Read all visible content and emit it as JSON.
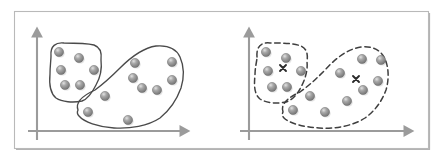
{
  "figure": {
    "width": 443,
    "height": 160,
    "background_color": "#ffffff",
    "frame": {
      "x": 14,
      "y": 11,
      "width": 414,
      "height": 137,
      "border_color": "#b9b9b9",
      "shadow_color": "#9a9a9a"
    },
    "colors": {
      "axis": "#9b9b9b",
      "point_fill": "#8f8f8f",
      "point_edge": "#6e6e6e",
      "point_highlight": "#dcdcdc",
      "hull_solid": "#4a4a4a",
      "hull_dashed": "#3f3f3f",
      "centroid": "#2b2b2b"
    }
  },
  "panels": [
    {
      "id": "left-panel",
      "name": "true-clusters-panel",
      "boundary_style": "solid",
      "shows_centroids": false,
      "origin": {
        "x": 37,
        "y": 131
      },
      "axes": {
        "x_axis": {
          "x1": 28,
          "y1": 131,
          "x2": 188,
          "y2": 131,
          "arrow": "right"
        },
        "y_axis": {
          "x1": 37,
          "y1": 140,
          "x2": 37,
          "y2": 29,
          "arrow": "up"
        }
      },
      "clusters": [
        {
          "id": "left-cluster-a",
          "label": "cluster-upper-left",
          "point_count": 6,
          "points": [
            {
              "x": 59,
              "y": 52
            },
            {
              "x": 79,
              "y": 58
            },
            {
              "x": 61,
              "y": 70
            },
            {
              "x": 94,
              "y": 70
            },
            {
              "x": 65,
              "y": 85
            },
            {
              "x": 80,
              "y": 85
            }
          ],
          "hull": "M 51 56 C 50 46 56 42 64 43 C 74 43 86 43 94 45 C 100 47 102 52 101 60 C 102 68 100 78 96 85 C 92 93 88 99 82 101 C 73 103 62 102 56 98 C 50 93 49 84 50 74 C 50 66 51 60 51 56 Z"
        },
        {
          "id": "left-cluster-b",
          "label": "cluster-lower-right",
          "point_count": 9,
          "points": [
            {
              "x": 135,
              "y": 63
            },
            {
              "x": 172,
              "y": 62
            },
            {
              "x": 133,
              "y": 78
            },
            {
              "x": 172,
              "y": 80
            },
            {
              "x": 105,
              "y": 96
            },
            {
              "x": 142,
              "y": 88
            },
            {
              "x": 157,
              "y": 90
            },
            {
              "x": 88,
              "y": 112
            },
            {
              "x": 128,
              "y": 120
            }
          ],
          "hull": "M 78 110 C 75 102 84 95 95 90 C 106 82 112 76 120 68 C 130 58 142 48 156 46 C 168 45 176 48 180 57 C 184 66 184 78 181 88 C 177 99 170 110 160 118 C 148 126 130 129 114 128 C 98 127 84 122 79 116 C 77 114 77 112 78 110 Z"
        }
      ]
    },
    {
      "id": "right-panel",
      "name": "kmeans-clusters-panel",
      "boundary_style": "dashed",
      "shows_centroids": true,
      "origin": {
        "x": 249,
        "y": 131
      },
      "axes": {
        "x_axis": {
          "x1": 240,
          "y1": 131,
          "x2": 412,
          "y2": 131,
          "arrow": "right"
        },
        "y_axis": {
          "x1": 249,
          "y1": 140,
          "x2": 249,
          "y2": 29,
          "arrow": "up"
        }
      },
      "clusters": [
        {
          "id": "right-cluster-a",
          "label": "kmeans-cluster-1",
          "point_count": 7,
          "centroid": {
            "x": 283,
            "y": 68,
            "marker": "x"
          },
          "points": [
            {
              "x": 266,
              "y": 52
            },
            {
              "x": 286,
              "y": 58
            },
            {
              "x": 268,
              "y": 71
            },
            {
              "x": 301,
              "y": 71
            },
            {
              "x": 272,
              "y": 87
            },
            {
              "x": 287,
              "y": 87
            },
            {
              "x": 310,
              "y": 96
            }
          ],
          "hull": "M 257 57 C 256 46 262 42 270 43 C 281 43 293 43 301 46 C 307 49 308 54 307 62 C 308 70 305 80 301 87 C 297 95 292 100 286 102 C 277 104 266 103 260 99 C 254 94 254 85 255 75 C 255 67 257 61 257 57 Z"
        },
        {
          "id": "right-cluster-b",
          "label": "kmeans-cluster-2",
          "point_count": 8,
          "centroid": {
            "x": 356,
            "y": 79,
            "marker": "x"
          },
          "points": [
            {
              "x": 340,
              "y": 73
            },
            {
              "x": 362,
              "y": 59
            },
            {
              "x": 381,
              "y": 60
            },
            {
              "x": 378,
              "y": 81
            },
            {
              "x": 363,
              "y": 90
            },
            {
              "x": 347,
              "y": 101
            },
            {
              "x": 325,
              "y": 112
            },
            {
              "x": 293,
              "y": 110
            }
          ],
          "hull": "M 283 112 C 280 104 289 97 300 92 C 311 84 317 78 325 70 C 335 59 347 49 361 47 C 373 46 381 50 385 59 C 389 68 389 80 386 90 C 382 101 375 111 365 118 C 353 126 335 129 319 128 C 303 127 289 123 284 118 C 282 116 282 114 283 112 Z"
        }
      ]
    }
  ]
}
